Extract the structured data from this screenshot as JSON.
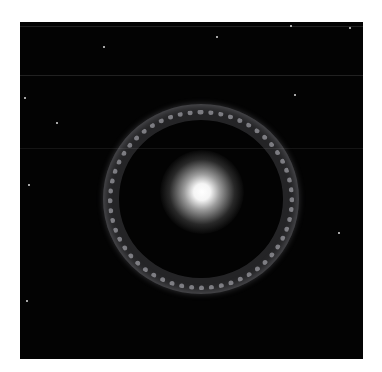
{
  "image": {
    "subject": "ring galaxy with bright central core",
    "background_color": "#030303",
    "frame_color": "#ffffff",
    "core_color": "#ffffff",
    "ring_color": "#c8c8d0"
  }
}
